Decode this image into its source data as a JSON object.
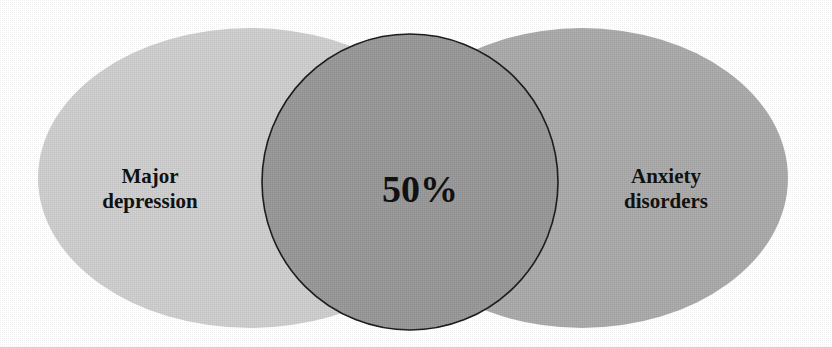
{
  "diagram": {
    "type": "venn",
    "sets": [
      {
        "id": "left",
        "label_lines": [
          "Major",
          "depression"
        ],
        "color": "#cdcdcd"
      },
      {
        "id": "right",
        "label_lines": [
          "Anxiety",
          "disorders"
        ],
        "color": "#a9a9a9"
      }
    ],
    "overlap": {
      "label": "50%",
      "color": "#979797",
      "outline": "#1a1a1a"
    }
  }
}
